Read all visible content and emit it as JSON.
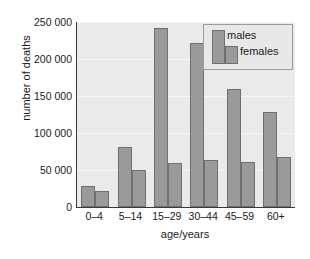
{
  "chart_data": {
    "type": "bar",
    "title": "",
    "xlabel": "age/years",
    "ylabel": "number of deaths",
    "categories": [
      "0–4",
      "5–14",
      "15–29",
      "30–44",
      "45–59",
      "60+"
    ],
    "series": [
      {
        "name": "males",
        "values": [
          28000,
          81000,
          242000,
          222000,
          160000,
          128000
        ]
      },
      {
        "name": "females",
        "values": [
          21000,
          50000,
          60000,
          64000,
          61000,
          68000
        ]
      }
    ],
    "ylim": [
      0,
      250000
    ],
    "ytick_values": [
      0,
      50000,
      100000,
      150000,
      200000,
      250000
    ],
    "ytick_labels": [
      "0",
      "50 000",
      "100 000",
      "150 000",
      "200 000",
      "250 000"
    ],
    "grid": true,
    "grid_axis": "y",
    "legend_position": "top-right",
    "legend_entries": [
      "males",
      "females"
    ],
    "colors": {
      "bar_fill": "#9a9a9a",
      "bar_edge": "#6f6f6f",
      "plot_background": "#eaeaea",
      "gridline": "#f6f6f6",
      "axis": "#3a3a3a",
      "text": "#1a1a1a",
      "legend_background": "#e8e8e8",
      "legend_border": "#9b9b9b",
      "figure_background": "#ffffff"
    }
  }
}
